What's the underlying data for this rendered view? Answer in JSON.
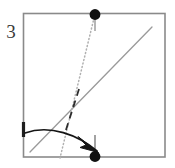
{
  "figure": {
    "step_label": "3",
    "title": "Origami folding diagram step 3",
    "colors": {
      "paper_edge": "#8a8a8a",
      "crease_solid": "#9a9a9a",
      "crease_dotted": "#b5b5b5",
      "crease_dashed": "#2a2a2a",
      "arrow": "#1a1a1a",
      "point_marker": "#111111",
      "tick": "#3a3a3a",
      "background": "#ffffff"
    },
    "square": {
      "left": 23,
      "top": 13,
      "right": 165,
      "bottom": 157
    },
    "markers": [
      {
        "name": "top-reference-point",
        "x": 95,
        "y": 14
      },
      {
        "name": "bottom-target-point",
        "x": 95,
        "y": 157
      }
    ],
    "ticks": [
      {
        "name": "top-edge-tick",
        "x1": 95,
        "y1": 14,
        "x2": 95,
        "y2": 30
      },
      {
        "name": "bottom-edge-tick",
        "x1": 95,
        "y1": 157,
        "x2": 95,
        "y2": 136
      },
      {
        "name": "left-edge-tick",
        "x1": 23,
        "y1": 123,
        "x2": 23,
        "y2": 136
      }
    ],
    "creases": [
      {
        "name": "valley-fold-solid-diagonal",
        "style": "solid",
        "x1": 30,
        "y1": 152,
        "x2": 152,
        "y2": 27
      },
      {
        "name": "reference-dotted-line",
        "style": "dotted",
        "x1": 95,
        "y1": 14,
        "x2": 60,
        "y2": 157
      },
      {
        "name": "mountain-fold-dashed-segment",
        "style": "dashed",
        "x1": 78,
        "y1": 91,
        "x2": 66,
        "y2": 131
      }
    ],
    "arrow": {
      "name": "fold-direction-arrow",
      "path": "M 25,133 C 55,125 82,138 99,152",
      "head": {
        "x": 99,
        "y": 152,
        "angle": 40
      }
    }
  }
}
